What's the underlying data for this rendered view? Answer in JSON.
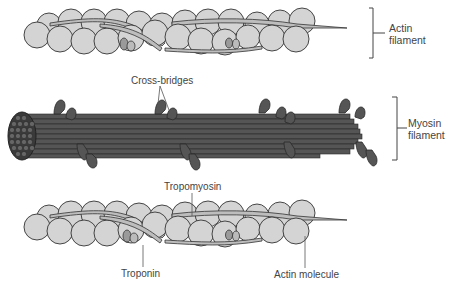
{
  "diagram": {
    "type": "biology-illustration",
    "panels": [
      {
        "id": "actin-top",
        "label": "Actin filament"
      },
      {
        "id": "myosin",
        "label": "Myosin filament"
      },
      {
        "id": "actin-bottom",
        "label": ""
      }
    ]
  },
  "labels": {
    "actin_filament_line1": "Actin",
    "actin_filament_line2": "filament",
    "cross_bridges": "Cross-bridges",
    "myosin_filament_line1": "Myosin",
    "myosin_filament_line2": "filament",
    "tropomyosin": "Tropomyosin",
    "troponin": "Troponin",
    "actin_molecule": "Actin molecule"
  },
  "colors": {
    "actin_bead_fill": "#d4d4d4",
    "actin_bead_stroke": "#333333",
    "tropomyosin_fill": "#bdbdbd",
    "troponin_fill": "#9a9a9a",
    "myosin_fill": "#555555",
    "myosin_line": "#2a2a2a",
    "label_text": "#444444",
    "leader_line": "#555555"
  }
}
